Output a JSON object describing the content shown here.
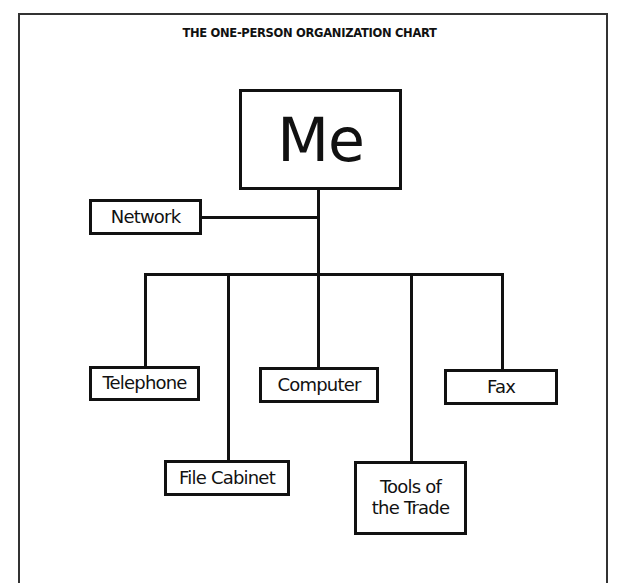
{
  "title": "THE ONE-PERSON ORGANIZATION CHART",
  "root": {
    "label": "Me"
  },
  "side": {
    "label": "Network"
  },
  "children": [
    {
      "label": "Telephone"
    },
    {
      "label": "File Cabinet"
    },
    {
      "label": "Computer"
    },
    {
      "label": "Tools of the Trade",
      "lines": [
        "Tools of",
        "the Trade"
      ]
    },
    {
      "label": "Fax"
    }
  ],
  "colors": {
    "line": "#111111",
    "background": "#ffffff",
    "frame": "#333333"
  }
}
